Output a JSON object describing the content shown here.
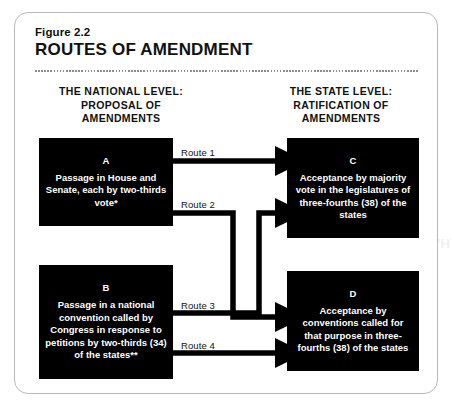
{
  "figure": {
    "label": "Figure 2.2",
    "title": "ROUTES OF AMENDMENT"
  },
  "columns": {
    "left_header": "THE NATIONAL LEVEL:\nPROPOSAL OF\nAMENDMENTS",
    "right_header": "THE STATE LEVEL:\nRATIFICATION OF\nAMENDMENTS"
  },
  "nodes": [
    {
      "id": "A",
      "letter": "A",
      "text": "Passage in House and Senate, each by two-thirds vote*"
    },
    {
      "id": "B",
      "letter": "B",
      "text": "Passage in a national convention called by Congress in response to petitions by two-thirds (34) of the states**"
    },
    {
      "id": "C",
      "letter": "C",
      "text": "Acceptance by majority vote in the legislatures of three-fourths (38) of the states"
    },
    {
      "id": "D",
      "letter": "D",
      "text": "Acceptance by conventions called for that purpose in three-fourths (38) of the states"
    }
  ],
  "routes": [
    {
      "id": "route-1",
      "label": "Route 1",
      "from": "A",
      "to": "C"
    },
    {
      "id": "route-2",
      "label": "Route 2",
      "from": "A",
      "to": "D"
    },
    {
      "id": "route-3",
      "label": "Route 3",
      "from": "B",
      "to": "C"
    },
    {
      "id": "route-4",
      "label": "Route 4",
      "from": "B",
      "to": "D"
    }
  ],
  "background": {
    "bleed_text_right": "HANDLING TH"
  },
  "colors": {
    "node_fill": "#000000",
    "node_text": "#ffffff",
    "frame_border": "#b9b9b9",
    "divider": "#8d8d8d",
    "page_text": "#111111"
  }
}
